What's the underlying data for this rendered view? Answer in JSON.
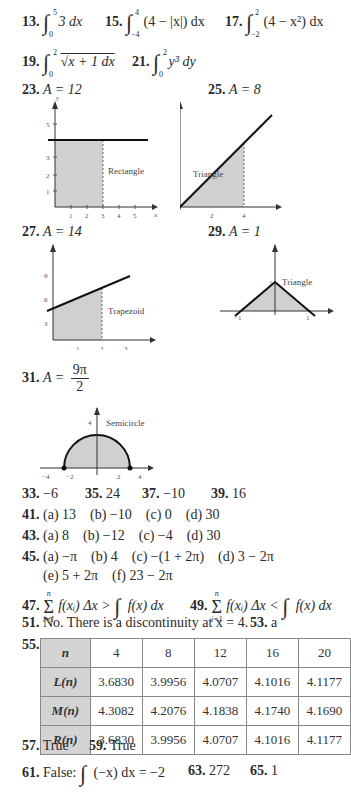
{
  "answers": {
    "a13": {
      "num": "13.",
      "upper": "5",
      "lower": "0",
      "integrand": "3 dx"
    },
    "a15": {
      "num": "15.",
      "upper": "4",
      "lower": "−4",
      "integrand": "(4 − |x|) dx"
    },
    "a17": {
      "num": "17.",
      "upper": "2",
      "lower": "−2",
      "integrand": "(4 − x²) dx"
    },
    "a19": {
      "num": "19.",
      "upper": "2",
      "lower": "0",
      "integrand": "√x + 1 dx"
    },
    "a21": {
      "num": "21.",
      "upper": "2",
      "lower": "0",
      "integrand": "y³ dy"
    },
    "a23": {
      "num": "23.",
      "text": "A = 12"
    },
    "a25": {
      "num": "25.",
      "text": "A = 8"
    },
    "a27": {
      "num": "27.",
      "text": "A = 14"
    },
    "a29": {
      "num": "29.",
      "text": "A = 1"
    },
    "a31": {
      "num": "31.",
      "lhs": "A =",
      "numer": "9π",
      "denom": "2"
    },
    "a33": {
      "num": "33.",
      "text": "−6"
    },
    "a35": {
      "num": "35.",
      "text": "24"
    },
    "a37": {
      "num": "37.",
      "text": "−10"
    },
    "a39": {
      "num": "39.",
      "text": "16"
    },
    "a41": {
      "num": "41.",
      "text": "(a) 13    (b) −10    (c) 0    (d) 30"
    },
    "a43": {
      "num": "43.",
      "text": "(a) 8    (b) −12    (c) −4    (d) 30"
    },
    "a45": {
      "num": "45.",
      "line1": "(a) −π    (b) 4    (c) −(1 + 2π)    (d) 3 − 2π",
      "line2": "(e) 5 + 2π    (f) 23 − 2π"
    },
    "a47": {
      "num": "47.",
      "sum_top": "n",
      "sum_bot": "i=1",
      "lhs": "f(xᵢ) Δx >",
      "upper": "5",
      "lower": "1",
      "rhs": "f(x) dx"
    },
    "a49": {
      "num": "49.",
      "sum_top": "n",
      "sum_bot": "i=1",
      "lhs": "f(xᵢ) Δx <",
      "upper": "5",
      "lower": "1",
      "rhs": "f(x) dx"
    },
    "a51": {
      "num": "51.",
      "text": "No. There is a discontinuity at x = 4."
    },
    "a53": {
      "num": "53.",
      "text": "a"
    },
    "a55": {
      "num": "55."
    },
    "a57": {
      "num": "57.",
      "text": "True"
    },
    "a59": {
      "num": "59.",
      "text": "True"
    },
    "a61": {
      "num": "61.",
      "prefix": "False:",
      "upper": "2",
      "lower": "0",
      "integrand": "(−x) dx = −2"
    },
    "a63": {
      "num": "63.",
      "text": "272"
    },
    "a65": {
      "num": "65.",
      "text": "1"
    }
  },
  "graphs": {
    "g23": {
      "label": "Rectangle",
      "ylabel": "y",
      "xlabel": "x",
      "xticks": [
        "1",
        "2",
        "3",
        "4",
        "5"
      ],
      "yticks": [
        "1",
        "2",
        "3",
        "5"
      ]
    },
    "g25": {
      "label": "Triangle",
      "ylabel": "y",
      "xlabel": "x",
      "xticks": [
        "2",
        "4"
      ],
      "yticks": [
        "2",
        "4"
      ]
    },
    "g27": {
      "label": "Trapezoid",
      "ylabel": "y",
      "xlabel": "x",
      "xticks": [
        "1",
        "2",
        "3"
      ],
      "yticks": [
        "3",
        "6",
        "9"
      ]
    },
    "g29": {
      "label": "Triangle",
      "ylabel": "y",
      "xlabel": "x",
      "xticks": [
        "−1",
        "1"
      ],
      "yticks": [
        "1"
      ]
    },
    "g31": {
      "label": "Semicircle",
      "ylabel": "y",
      "xlabel": "x",
      "xticks": [
        "−4",
        "−2",
        "2",
        "4"
      ],
      "yticks": [
        "4"
      ]
    }
  },
  "table55": {
    "header": [
      "n",
      "4",
      "8",
      "12",
      "16",
      "20"
    ],
    "rows": [
      {
        "label": "L(n)",
        "values": [
          "3.6830",
          "3.9956",
          "4.0707",
          "4.1016",
          "4.1177"
        ]
      },
      {
        "label": "M(n)",
        "values": [
          "4.3082",
          "4.2076",
          "4.1838",
          "4.1740",
          "4.1690"
        ]
      },
      {
        "label": "R(n)",
        "values": [
          "3.6830",
          "3.9956",
          "4.0707",
          "4.1016",
          "4.1177"
        ]
      }
    ]
  },
  "colors": {
    "fill": "#d0d0d0",
    "line": "#222222",
    "table_header": "#d4d4d4"
  }
}
